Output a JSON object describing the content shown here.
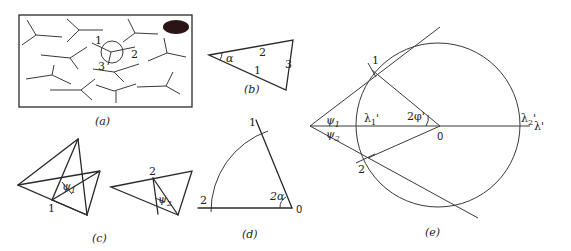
{
  "figure": {
    "panels": [
      {
        "id": "a",
        "caption": "(a)",
        "labels": [
          "1",
          "2",
          "3"
        ],
        "description": "Rectangular frame containing many Y-shaped (three-armed) molecules; one molecule circled with arms labeled 1, 2, 3; filled dark ellipse in upper right corner"
      },
      {
        "id": "b",
        "caption": "(b)",
        "angle_label": "α",
        "side_labels": [
          "2",
          "1",
          "3"
        ],
        "description": "Triangle with angle alpha at left vertex; sides labeled 1, 2, 3"
      },
      {
        "id": "c",
        "caption": "(c)",
        "vertex_labels": [
          "1",
          "2"
        ],
        "angle_labels": [
          "ψ1",
          "ψ2"
        ],
        "description": "Two pairs of overlapping triangles showing angles psi1 and psi2"
      },
      {
        "id": "d",
        "caption": "(d)",
        "point_labels": [
          "1",
          "2",
          "0"
        ],
        "angle_label": "2α",
        "description": "Arc centered at 0 with a horizontal ray to point 2 and an inclined ray to point 1, forming angle 2 alpha"
      },
      {
        "id": "e",
        "caption": "(e)",
        "point_labels": [
          "1",
          "2",
          "0"
        ],
        "angle_labels": [
          "ψ1",
          "ψ2",
          "2φ'"
        ],
        "axis_labels": [
          "λ1'",
          "λ2'",
          "λ'"
        ],
        "description": "Circle with horizontal λ' axis; tangent lines from an external point to points 1 and 2 on the circle; radii from 0 to points 1 and 2 forming angle 2 phi'"
      }
    ]
  },
  "text": {
    "a_caption": "(a)",
    "a_l1": "1",
    "a_l2": "2",
    "a_l3": "3",
    "b_caption": "(b)",
    "b_alpha": "α",
    "b_s2": "2",
    "b_s1": "1",
    "b_s3": "3",
    "c_caption": "(c)",
    "c_v1": "1",
    "c_v2": "2",
    "c_psi1": "ψ",
    "c_psi1_sub": "1",
    "c_psi2": "ψ",
    "c_psi2_sub": "2",
    "d_caption": "(d)",
    "d_p1": "1",
    "d_p2": "2",
    "d_p0": "0",
    "d_angle": "2α",
    "e_caption": "(e)",
    "e_p1": "1",
    "e_p2": "2",
    "e_p0": "0",
    "e_psi1": "ψ",
    "e_psi1_sub": "1",
    "e_psi2": "ψ",
    "e_psi2_sub": "2",
    "e_phi": "2φ'",
    "e_lambda1": "λ",
    "e_lambda1_sub": "1",
    "e_lambda1_prime": "'",
    "e_lambda2": "λ",
    "e_lambda2_sub": "2",
    "e_lambda2_prime": "'",
    "e_lambda_axis": "λ'"
  },
  "colors": {
    "stroke": "#2a2a2a",
    "fill_dark": "#2b1414",
    "background": "#ffffff"
  }
}
